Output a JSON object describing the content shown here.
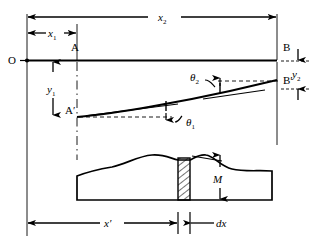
{
  "figure": {
    "ink_color": "#000000",
    "background_color": "#ffffff"
  },
  "labels": {
    "origin": "O",
    "point_a": "A",
    "point_a_prime": "A′",
    "point_b": "B",
    "point_b_prime": "B′",
    "moment": "M"
  },
  "dimensions": {
    "x1": {
      "symbol": "x",
      "subscript": "1"
    },
    "x2": {
      "symbol": "x",
      "subscript": "2"
    },
    "y1": {
      "symbol": "y",
      "subscript": "1"
    },
    "y2": {
      "symbol": "y",
      "subscript": "2"
    },
    "x_prime": {
      "symbol": "x",
      "prime": "′"
    },
    "dx": {
      "symbol": "dx"
    }
  },
  "angles": {
    "theta1": {
      "symbol": "θ",
      "subscript": "1"
    },
    "theta2": {
      "symbol": "θ",
      "subscript": "2"
    }
  }
}
